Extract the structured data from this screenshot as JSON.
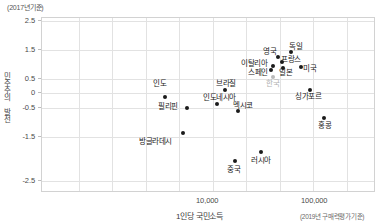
{
  "unit_note": "(2017년기준)",
  "axes": {
    "y_title": "민주주의 발전",
    "x_title": "1인당 국민소득",
    "x_note": "(2019년 구매력평가기준)",
    "y_ticks": [
      "2.5",
      "1.5",
      "0.5",
      "0",
      "-0.5",
      "-1.5",
      "-2.5"
    ],
    "x_ticks": [
      "10,000",
      "100,000"
    ]
  },
  "chart_data": {
    "type": "scatter",
    "title": "",
    "subtitle": "",
    "xlabel": "1인당 국민소득",
    "ylabel": "민주주의 발전",
    "xscale": "log",
    "xlim": [
      1000,
      200000
    ],
    "ylim": [
      -2.5,
      2.5
    ],
    "grid": true,
    "legend": "none",
    "annotations": [
      "(2017년기준)",
      "(2019년 구매력평가기준)"
    ],
    "points": [
      {
        "label": "인도",
        "x": 6500,
        "y": 0.48,
        "highlight": false
      },
      {
        "label": "필리핀",
        "x": 8500,
        "y": 0.18,
        "highlight": false
      },
      {
        "label": "방글라데시",
        "x": 4800,
        "y": -0.85,
        "highlight": false
      },
      {
        "label": "인도네시아",
        "x": 12000,
        "y": 0.26,
        "highlight": false
      },
      {
        "label": "브라질",
        "x": 14500,
        "y": 0.62,
        "highlight": false
      },
      {
        "label": "멕시코",
        "x": 19500,
        "y": 0.1,
        "highlight": false
      },
      {
        "label": "중국",
        "x": 16500,
        "y": -1.55,
        "highlight": false
      },
      {
        "label": "러시아",
        "x": 27000,
        "y": -1.25,
        "highlight": false
      },
      {
        "label": "이탈리아",
        "x": 42000,
        "y": 1.05,
        "highlight": false
      },
      {
        "label": "스페인",
        "x": 40000,
        "y": 1.18,
        "highlight": false
      },
      {
        "label": "영국",
        "x": 45000,
        "y": 1.48,
        "highlight": false
      },
      {
        "label": "프랑스",
        "x": 47000,
        "y": 1.32,
        "highlight": false
      },
      {
        "label": "독일",
        "x": 54000,
        "y": 1.62,
        "highlight": false
      },
      {
        "label": "일본",
        "x": 44000,
        "y": 1.08,
        "highlight": false
      },
      {
        "label": "미국",
        "x": 63000,
        "y": 1.1,
        "highlight": false
      },
      {
        "label": "한국",
        "x": 42000,
        "y": 0.78,
        "highlight": true
      },
      {
        "label": "싱가포르",
        "x": 95000,
        "y": 0.4,
        "highlight": false
      },
      {
        "label": "홍콩",
        "x": 125000,
        "y": -0.45,
        "highlight": false
      }
    ]
  },
  "layout": {
    "plot": {
      "left": 41,
      "top": 17,
      "width": 334,
      "height": 175
    },
    "y_tick_y": [
      20,
      49,
      78,
      92,
      107,
      136,
      180
    ],
    "x_grid_x": [
      37,
      70,
      104,
      137,
      171,
      204,
      238,
      271,
      305
    ],
    "x_tick_positions": [
      {
        "label_index": 0,
        "x": 196
      },
      {
        "label_index": 1,
        "x": 301
      }
    ],
    "points_px": [
      {
        "label": "인도",
        "cx": 164,
        "cy": 96,
        "lx": 152,
        "ly": 79
      },
      {
        "label": "필리핀",
        "cx": 186,
        "cy": 107,
        "lx": 157,
        "ly": 102
      },
      {
        "label": "방글라데시",
        "cx": 182,
        "cy": 132,
        "lx": 138,
        "ly": 137
      },
      {
        "label": "인도네시아",
        "cx": 216,
        "cy": 103,
        "lx": 202,
        "ly": 93
      },
      {
        "label": "브라질",
        "cx": 224,
        "cy": 89,
        "lx": 215,
        "ly": 79
      },
      {
        "label": "멕시코",
        "cx": 237,
        "cy": 110,
        "lx": 232,
        "ly": 101
      },
      {
        "label": "중국",
        "cx": 234,
        "cy": 160,
        "lx": 226,
        "ly": 165
      },
      {
        "label": "러시아",
        "cx": 260,
        "cy": 151,
        "lx": 250,
        "ly": 156
      },
      {
        "label": "이탈리아",
        "cx": 272,
        "cy": 65,
        "lx": 240,
        "ly": 59
      },
      {
        "label": "스페인",
        "cx": 270,
        "cy": 69,
        "lx": 247,
        "ly": 68
      },
      {
        "label": "영국",
        "cx": 277,
        "cy": 56,
        "lx": 262,
        "ly": 47
      },
      {
        "label": "프랑스",
        "cx": 281,
        "cy": 61,
        "lx": 280,
        "ly": 55
      },
      {
        "label": "독일",
        "cx": 290,
        "cy": 51,
        "lx": 288,
        "ly": 42
      },
      {
        "label": "일본",
        "cx": 282,
        "cy": 67,
        "lx": 278,
        "ly": 68
      },
      {
        "label": "미국",
        "cx": 300,
        "cy": 66,
        "lx": 302,
        "ly": 64
      },
      {
        "label": "한국",
        "cx": 272,
        "cy": 76,
        "lx": 265,
        "ly": 79
      },
      {
        "label": "싱가포르",
        "cx": 309,
        "cy": 89,
        "lx": 294,
        "ly": 92
      },
      {
        "label": "홍콩",
        "cx": 323,
        "cy": 117,
        "lx": 317,
        "ly": 121
      }
    ]
  }
}
